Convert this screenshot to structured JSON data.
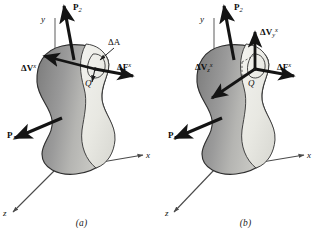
{
  "figure": {
    "type": "mechanics-diagram",
    "panels": [
      {
        "id": "a",
        "caption": "(a)",
        "axes": {
          "y_label": "y",
          "x_label": "x",
          "z_label": "z"
        },
        "point_label": "Q",
        "area_label": "ΔA",
        "loads": [
          {
            "name": "P2",
            "base": "P",
            "sub": "2",
            "sup": ""
          },
          {
            "name": "P1",
            "base": "P",
            "sub": "1",
            "sup": ""
          }
        ],
        "vectors": [
          {
            "name": "delta-V-x",
            "base": "ΔV",
            "sub": "",
            "sup": "x"
          },
          {
            "name": "delta-F-x",
            "base": "ΔF",
            "sub": "",
            "sup": "x"
          }
        ]
      },
      {
        "id": "b",
        "caption": "(b)",
        "axes": {
          "y_label": "y",
          "x_label": "x",
          "z_label": "z"
        },
        "point_label": "Q",
        "area_label": "",
        "loads": [
          {
            "name": "P2",
            "base": "P",
            "sub": "2",
            "sup": ""
          },
          {
            "name": "P1",
            "base": "P",
            "sub": "1",
            "sup": ""
          }
        ],
        "vectors": [
          {
            "name": "delta-Vy-x",
            "base": "ΔV",
            "sub": "y",
            "sup": "x"
          },
          {
            "name": "delta-Vz-x",
            "base": "ΔV",
            "sub": "z",
            "sup": "x"
          },
          {
            "name": "delta-F-x",
            "base": "ΔF",
            "sub": "",
            "sup": "x"
          }
        ]
      }
    ],
    "colors": {
      "body_dark": "#8e8e8e",
      "body_light": "#e9e9e4",
      "outline": "#3a3a3a",
      "arrow": "#141414",
      "axis": "#4a4a4a",
      "text": "#101010",
      "background": "#ffffff"
    }
  }
}
